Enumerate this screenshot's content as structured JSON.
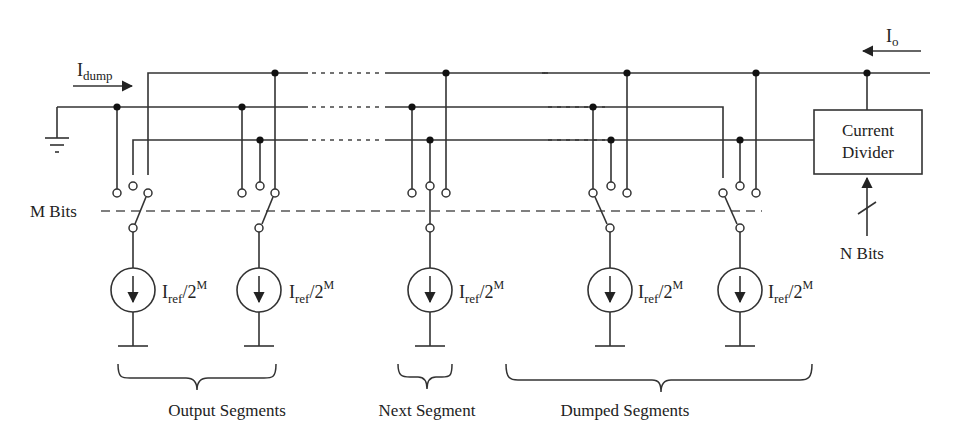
{
  "diagram": {
    "labels": {
      "i_dump": "I",
      "i_dump_sub": "dump",
      "i_out": "I",
      "i_out_sub": "o",
      "m_bits": "M Bits",
      "n_bits": "N Bits",
      "divider_line1": "Current",
      "divider_line2": "Divider"
    },
    "source_label": {
      "main": "I",
      "sub": "ref",
      "slash_two": "/2",
      "sup": "M"
    },
    "rails": [
      {
        "id": "output-rail",
        "role": "I_o output current"
      },
      {
        "id": "dump-rail",
        "role": "I_dump to ground"
      },
      {
        "id": "divider-rail",
        "role": "feeds current divider"
      }
    ],
    "segments": [
      {
        "name": "segment-1",
        "group": "Output Segments",
        "switch_to": "output-rail"
      },
      {
        "name": "segment-2",
        "group": "Output Segments",
        "switch_to": "output-rail"
      },
      {
        "name": "segment-3",
        "group": "Next Segment",
        "switch_to": "divider-rail"
      },
      {
        "name": "segment-4",
        "group": "Dumped Segments",
        "switch_to": "dump-rail"
      },
      {
        "name": "segment-5",
        "group": "Dumped Segments",
        "switch_to": "dump-rail"
      }
    ],
    "groups": [
      {
        "label": "Output Segments"
      },
      {
        "label": "Next Segment"
      },
      {
        "label": "Dumped Segments"
      }
    ]
  }
}
